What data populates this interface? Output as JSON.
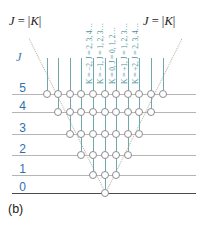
{
  "figure": {
    "caption": "(b)",
    "axis_label_j": "J",
    "boundary_label_left": "J = |K|",
    "boundary_label_right": "J = |K|",
    "type": "symmetric-top rotational energy level diagram"
  },
  "colors": {
    "level_line": "#b5b5b5",
    "baseline": "#4a4a4a",
    "k_line": "#6fa8ac",
    "k_label_text": "#4c8f96",
    "j_tick_text": "#2f6fae",
    "circle_stroke": "#8d8d8d",
    "circle_fill": "#ffffff",
    "diagonal_dotted": "#b9b0a8",
    "text": "#1a1a1a"
  },
  "j_levels": [
    {
      "label": "5",
      "j": 5,
      "states": 11
    },
    {
      "label": "4",
      "j": 4,
      "states": 9
    },
    {
      "label": "3",
      "j": 3,
      "states": 7
    },
    {
      "label": "2",
      "j": 2,
      "states": 5
    },
    {
      "label": "1",
      "j": 1,
      "states": 3
    },
    {
      "label": "0",
      "j": 0,
      "states": 1
    }
  ],
  "k_series_labels": [
    {
      "k": -2,
      "text": "K = −2, J = 2, 3, 4…"
    },
    {
      "k": -1,
      "text": "K = −1, J = 1, 2, 3…"
    },
    {
      "k": 0,
      "text": "K = 0, J = 0, 1, 2…"
    },
    {
      "k": 1,
      "text": "K = +1, J = 1, 2, 3…"
    },
    {
      "k": 2,
      "text": "K = +2, J = 2, 3, 4…"
    }
  ],
  "chart_data": {
    "type": "scatter",
    "title": "",
    "xlabel": "K",
    "ylabel": "J",
    "x": [
      -5,
      -4,
      -3,
      -2,
      -1,
      0,
      1,
      2,
      3,
      4,
      5
    ],
    "series": [
      {
        "name": "J = 5",
        "j": 5,
        "k_values": [
          -5,
          -4,
          -3,
          -2,
          -1,
          0,
          1,
          2,
          3,
          4,
          5
        ]
      },
      {
        "name": "J = 4",
        "j": 4,
        "k_values": [
          -4,
          -3,
          -2,
          -1,
          0,
          1,
          2,
          3,
          4
        ]
      },
      {
        "name": "J = 3",
        "j": 3,
        "k_values": [
          -3,
          -2,
          -1,
          0,
          1,
          2,
          3
        ]
      },
      {
        "name": "J = 2",
        "j": 2,
        "k_values": [
          -2,
          -1,
          0,
          1,
          2
        ]
      },
      {
        "name": "J = 1",
        "j": 1,
        "k_values": [
          -1,
          0,
          1
        ]
      },
      {
        "name": "J = 0",
        "j": 0,
        "k_values": [
          0
        ]
      }
    ],
    "ylim": [
      0,
      5
    ],
    "xlim": [
      -5,
      5
    ],
    "grid": false,
    "legend": "none",
    "annotations": [
      "J = |K|",
      "J = |K|"
    ]
  }
}
